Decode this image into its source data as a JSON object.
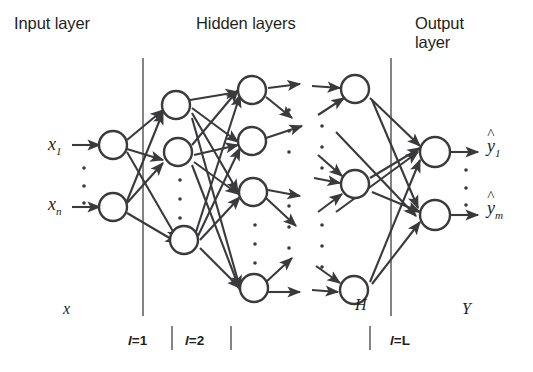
{
  "figure": {
    "type": "diagram",
    "background_color": "#ffffff",
    "ink_color": "#231f20"
  },
  "headers": {
    "input": "Input layer",
    "hidden": "Hidden layers",
    "output": "Output\nlayer"
  },
  "input_layer": {
    "node_labels": [
      "x",
      "x"
    ],
    "node_subs": [
      "1",
      "n"
    ],
    "group_label": "x",
    "node_count_visible": 2,
    "ellipsis_dots": 3
  },
  "output_layer": {
    "node_labels": [
      "y",
      "y"
    ],
    "node_subs": [
      "1",
      "m"
    ],
    "hat_mark": "^",
    "group_label": "Y",
    "node_count_visible": 2,
    "ellipsis_dots": 3
  },
  "hidden_layers": {
    "group_label": "H",
    "layers": [
      {
        "tick": "l=1",
        "tick_var": "l",
        "tick_rest": "=1",
        "nodes_visible": 3
      },
      {
        "tick": "l=2",
        "tick_var": "l",
        "tick_rest": "=2",
        "nodes_visible": 4
      },
      {
        "tick": "l=L",
        "tick_var": "l",
        "tick_rest": "=L",
        "nodes_visible": 3
      }
    ]
  },
  "dividers": {
    "left_x": 143,
    "right_x": 391,
    "count": 2
  },
  "tick_marks": {
    "labels": [
      "l=1",
      "l=2",
      "l=L"
    ],
    "count": 3
  }
}
